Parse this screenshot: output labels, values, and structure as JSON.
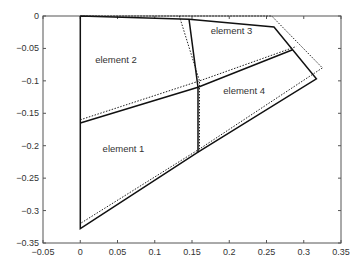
{
  "chart_data": {
    "type": "line",
    "title": "",
    "xlabel": "",
    "ylabel": "",
    "xlim": [
      -0.05,
      0.35
    ],
    "ylim": [
      -0.35,
      0
    ],
    "grid": false,
    "legend": null,
    "x_ticks": [
      "-0.05",
      "0",
      "0.05",
      "0.1",
      "0.15",
      "0.2",
      "0.25",
      "0.3",
      "0.35"
    ],
    "y_ticks": [
      "0",
      "-0.05",
      "-0.1",
      "-0.15",
      "-0.2",
      "-0.25",
      "-0.3",
      "-0.35"
    ],
    "annotations": [
      {
        "text": "element 1",
        "x": 0.03,
        "y": -0.21
      },
      {
        "text": "element 2",
        "x": 0.02,
        "y": -0.073
      },
      {
        "text": "element 3",
        "x": 0.175,
        "y": -0.027
      },
      {
        "text": "element 4",
        "x": 0.192,
        "y": -0.12
      }
    ],
    "series": [
      {
        "name": "deformed mesh",
        "style": "solid",
        "color": "#111111",
        "polylines": [
          [
            [
              0,
              0
            ],
            [
              0.146,
              -0.005
            ],
            [
              0.26,
              -0.017
            ],
            [
              0.317,
              -0.097
            ],
            [
              0.158,
              -0.21
            ],
            [
              0,
              -0.328
            ],
            [
              0,
              0
            ]
          ],
          [
            [
              0,
              -0.165
            ],
            [
              0.158,
              -0.11
            ],
            [
              0.285,
              -0.052
            ]
          ],
          [
            [
              0.146,
              -0.005
            ],
            [
              0.158,
              -0.11
            ],
            [
              0.158,
              -0.21
            ]
          ]
        ]
      },
      {
        "name": "undeformed mesh",
        "style": "dotted",
        "color": "#222222",
        "polylines": [
          [
            [
              0,
              0
            ],
            [
              0.133,
              0
            ],
            [
              0.257,
              0
            ],
            [
              0.325,
              -0.08
            ],
            [
              0.16,
              -0.205
            ],
            [
              0,
              -0.32
            ]
          ],
          [
            [
              0,
              -0.16
            ],
            [
              0.16,
              -0.1
            ],
            [
              0.29,
              -0.047
            ]
          ],
          [
            [
              0.133,
              0
            ],
            [
              0.16,
              -0.1
            ],
            [
              0.16,
              -0.205
            ]
          ]
        ]
      }
    ]
  }
}
